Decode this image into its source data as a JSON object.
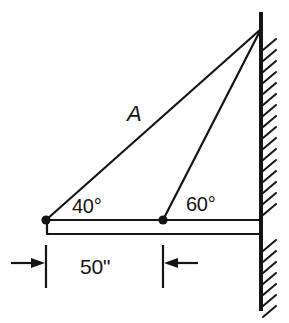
{
  "diagram": {
    "type": "statics-free-body-diagram",
    "labels": {
      "angle_left": "40°",
      "angle_right": "60°",
      "member_a": "A",
      "dimension": "50\""
    },
    "colors": {
      "stroke": "#151515",
      "background": "#ffffff",
      "text": "#151515"
    },
    "geometry": {
      "apex": {
        "x": 261,
        "y": 29
      },
      "node_left": {
        "x": 46,
        "y": 220
      },
      "node_mid": {
        "x": 163,
        "y": 220
      },
      "wall": {
        "x": 261,
        "y_top": 12,
        "y_bottom": 311,
        "hatch_side": "right",
        "hatch_angle_deg": 45,
        "hatch_spacing": 11
      },
      "beam": {
        "y_top": 220,
        "y_bottom": 234,
        "x_left": 46,
        "x_right": 261
      },
      "dimension_line": {
        "y": 263,
        "x_left_ext": 46,
        "x_right_ext": 163,
        "ext_y_top": 245,
        "ext_y_bottom": 288
      }
    },
    "elements": {
      "member_a_name": "member-a-line",
      "member_b_name": "member-b-line",
      "wall_name": "wall-line",
      "beam_name": "horizontal-beam",
      "pin_left_name": "pin-joint-left",
      "pin_mid_name": "pin-joint-middle"
    }
  }
}
